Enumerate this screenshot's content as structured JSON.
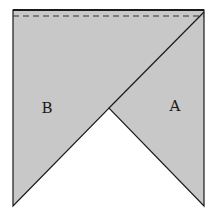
{
  "diagram": {
    "colors": {
      "fill": "#c8c8c8",
      "stroke": "#1a1a1a",
      "background": "#ffffff"
    },
    "labels": {
      "region_b": "B",
      "region_a": "A"
    }
  }
}
